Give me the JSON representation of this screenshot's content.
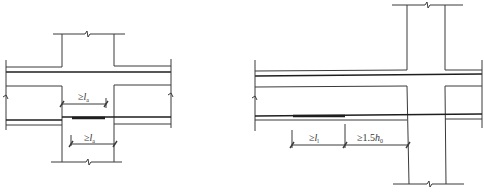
{
  "figure": {
    "left": {
      "title": "beam bottom bar lap in column joint",
      "dimensions": [
        {
          "prefix": "≥",
          "symbol": "l",
          "subscript": "a",
          "position": "upper"
        },
        {
          "prefix": "≥",
          "symbol": "l",
          "subscript": "a",
          "position": "lower"
        }
      ]
    },
    "right": {
      "title": "beam bottom bar lap outside joint",
      "dimensions": [
        {
          "prefix": "≥",
          "symbol": "l",
          "subscript": "l",
          "position": "left"
        },
        {
          "prefix": "≥1.5",
          "symbol": "h",
          "subscript": "0",
          "position": "right"
        }
      ]
    }
  },
  "colors": {
    "line": "#3a3a3a",
    "rebar": "#1e1e1e",
    "background": "#ffffff"
  }
}
